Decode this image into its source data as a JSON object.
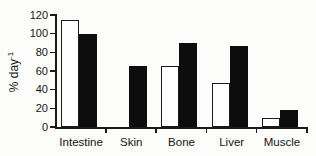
{
  "chart_data": {
    "type": "bar",
    "title": "",
    "ylabel": "% day⁻¹",
    "ylabel_base": "% day",
    "ylabel_sup": "-1",
    "xlabel": "",
    "categories": [
      "Intestine",
      "Skin",
      "Bone",
      "Liver",
      "Muscle"
    ],
    "series": [
      {
        "name": "open",
        "fill": "#ffffff",
        "outline": "#1a1a1a",
        "values": [
          115,
          0,
          65,
          47,
          10
        ]
      },
      {
        "name": "filled",
        "fill": "#0d0d0d",
        "outline": "#0d0d0d",
        "values": [
          100,
          65,
          90,
          87,
          18
        ]
      }
    ],
    "ylim": [
      0,
      120
    ],
    "yticks": [
      0,
      20,
      40,
      60,
      80,
      100,
      120
    ],
    "grid": false,
    "legend": "none",
    "axis_color": "#1a1a1a",
    "background_color": "#fcfcfb"
  }
}
